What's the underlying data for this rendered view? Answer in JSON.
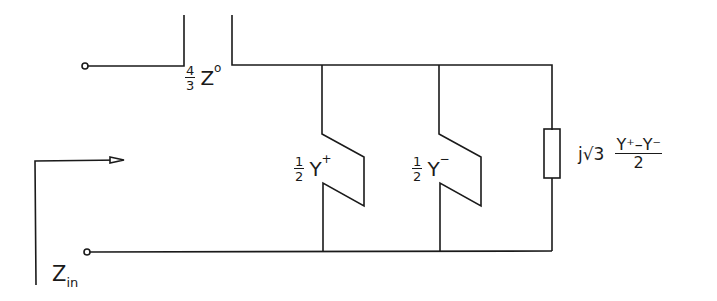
{
  "diagram": {
    "type": "equivalent circuit",
    "input_impedance": {
      "symbol": "Z",
      "subscript": "in"
    },
    "series_element": {
      "coef_num": "4",
      "coef_den": "3",
      "symbol": "Z",
      "superscript": "o"
    },
    "shunt_branches": [
      {
        "coef_num": "1",
        "coef_den": "2",
        "symbol": "Y",
        "superscript": "+"
      },
      {
        "coef_num": "1",
        "coef_den": "2",
        "symbol": "Y",
        "superscript": "−"
      },
      {
        "prefix": "j√3",
        "numerator": "Y⁺–Y⁻",
        "denominator": "2"
      }
    ],
    "colors": {
      "line": "#1a1a1a",
      "background": "#ffffff"
    }
  }
}
